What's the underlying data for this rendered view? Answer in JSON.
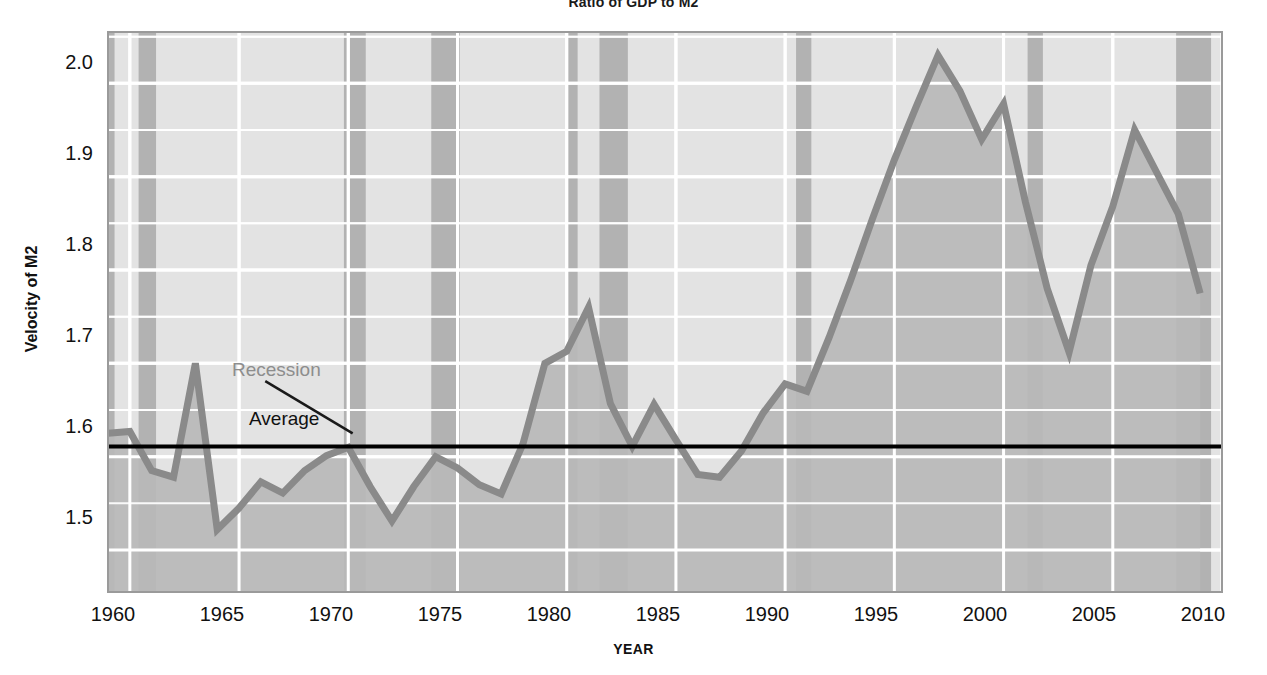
{
  "chart_data": {
    "type": "line",
    "title": "Ratio of GDP to M2",
    "xlabel": "YEAR",
    "ylabel": "Velocity of M2",
    "xlim": [
      1959,
      2010
    ],
    "ylim": [
      1.455,
      2.055
    ],
    "xticks": [
      1960,
      1965,
      1970,
      1975,
      1980,
      1985,
      1990,
      1995,
      2000,
      2005,
      2010
    ],
    "yticks": [
      1.5,
      1.6,
      1.7,
      1.8,
      1.9,
      2.0
    ],
    "ytick_labels": [
      "1.5",
      "1.6",
      "1.7",
      "1.8",
      "1.9",
      "2.0"
    ],
    "xtick_labels": [
      "1960",
      "1965",
      "1970",
      "1975",
      "1980",
      "1985",
      "1990",
      "1995",
      "2000",
      "2005",
      "2010"
    ],
    "grid": true,
    "grid_major_step": 0.1,
    "grid_minor_step": 0.05,
    "legend": "none",
    "series": [
      {
        "name": "Velocity of M2",
        "color": "#8a8a8a",
        "fill": true,
        "x": [
          1959,
          1960,
          1961,
          1962,
          1963,
          1964,
          1965,
          1966,
          1967,
          1968,
          1969,
          1970,
          1971,
          1972,
          1973,
          1974,
          1975,
          1976,
          1977,
          1978,
          1979,
          1980,
          1981,
          1982,
          1983,
          1984,
          1985,
          1986,
          1987,
          1988,
          1989,
          1990,
          1991,
          1992,
          1993,
          1994,
          1995,
          1996,
          1997,
          1998,
          1999,
          2000,
          2001,
          2002,
          2003,
          2004,
          2005,
          2006,
          2007,
          2008,
          2009
        ],
        "values": [
          1.625,
          1.627,
          1.585,
          1.578,
          1.7,
          1.522,
          1.545,
          1.573,
          1.561,
          1.585,
          1.601,
          1.61,
          1.568,
          1.531,
          1.568,
          1.6,
          1.588,
          1.57,
          1.56,
          1.614,
          1.7,
          1.713,
          1.76,
          1.657,
          1.611,
          1.656,
          1.618,
          1.581,
          1.578,
          1.606,
          1.647,
          1.678,
          1.67,
          1.727,
          1.789,
          1.855,
          1.918,
          1.975,
          2.03,
          1.992,
          1.94,
          1.978,
          1.873,
          1.78,
          1.712,
          1.805,
          1.868,
          1.95,
          1.905,
          1.86,
          1.775
        ]
      }
    ],
    "reference_lines": [
      {
        "name": "Average",
        "type": "horizontal",
        "value": 1.611,
        "color": "#000000",
        "label": "Average"
      }
    ],
    "shaded_regions": {
      "name": "Recession",
      "label": "Recession",
      "color": "#b0b0b0",
      "spans": [
        [
          1959.0,
          1959.3
        ],
        [
          1960.4,
          1961.2
        ],
        [
          1969.8,
          1970.8
        ],
        [
          1973.8,
          1975.1
        ],
        [
          1980.0,
          1980.5
        ],
        [
          1981.5,
          1982.8
        ],
        [
          1990.5,
          1991.2
        ],
        [
          2001.1,
          2001.8
        ],
        [
          2007.9,
          2009.5
        ]
      ]
    },
    "annotations": [
      {
        "text": "Recession",
        "x": 1963.2,
        "y": 1.687,
        "color": "#8d8d8d",
        "leader_to_x": 1970.2,
        "leader_to_y": 1.625
      },
      {
        "text": "Average",
        "x": 1964.0,
        "y": 1.632,
        "color": "#111111"
      }
    ]
  },
  "figure": {
    "title": "Ratio of GDP to M2",
    "x_axis_title": "YEAR",
    "y_axis_title": "Velocity of M2",
    "y_tick_labels": [
      "2.0",
      "1.9",
      "1.8",
      "1.7",
      "1.6",
      "1.5"
    ],
    "x_tick_labels": [
      "1960",
      "1965",
      "1970",
      "1975",
      "1980",
      "1985",
      "1990",
      "1995",
      "2000",
      "2005",
      "2010"
    ],
    "annotation_recession": "Recession",
    "annotation_average": "Average",
    "colors": {
      "plot_background": "#e3e3e3",
      "fill_under_curve": "#b9b9b9",
      "line": "#8a8a8a",
      "recession_band": "#b2b2b2",
      "gridline": "#ffffff",
      "average_line": "#000000",
      "text": "#111111"
    }
  }
}
